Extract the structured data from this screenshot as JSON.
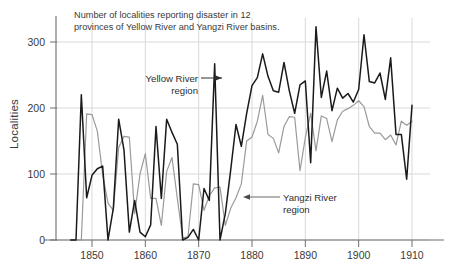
{
  "figure": {
    "title_line1": "Number of localities reporting disaster in 12",
    "title_line2": "provinces of Yellow River and Yangzi River basins.",
    "y_axis_label": "Localities",
    "annotation_yellow_line1": "Yellow River",
    "annotation_yellow_line2": "region",
    "annotation_yangzi_line1": "Yangzi River",
    "annotation_yangzi_line2": "region",
    "colors": {
      "yellow_river_line": "#1a1a1a",
      "yangzi_river_line": "#9a9a9a",
      "grid": "#d9d9d9",
      "axis": "#6e6e6e",
      "text": "#3a3a3a",
      "background": "#ffffff"
    }
  },
  "chart_data": {
    "type": "line",
    "title": "Number of localities reporting disaster in 12 provinces of Yellow River and Yangzi River basins.",
    "xlabel": "",
    "ylabel": "Localities",
    "xlim": [
      1846,
      1912
    ],
    "ylim": [
      0,
      320
    ],
    "xticks": [
      1850,
      1860,
      1870,
      1880,
      1890,
      1900,
      1910
    ],
    "yticks": [
      0,
      100,
      200,
      300
    ],
    "grid": true,
    "legend": "annotations",
    "series": [
      {
        "name": "Yellow River region",
        "color": "#1a1a1a",
        "x": [
          1846,
          1847,
          1848,
          1849,
          1850,
          1851,
          1852,
          1853,
          1854,
          1855,
          1856,
          1857,
          1858,
          1859,
          1860,
          1861,
          1862,
          1863,
          1864,
          1865,
          1866,
          1867,
          1868,
          1869,
          1870,
          1871,
          1872,
          1873,
          1874,
          1875,
          1876,
          1877,
          1878,
          1879,
          1880,
          1881,
          1882,
          1883,
          1884,
          1885,
          1886,
          1887,
          1888,
          1889,
          1890,
          1891,
          1892,
          1893,
          1894,
          1895,
          1896,
          1897,
          1898,
          1899,
          1900,
          1901,
          1902,
          1903,
          1904,
          1905,
          1906,
          1907,
          1908,
          1909,
          1910
        ],
        "values": [
          0,
          0,
          220,
          64,
          98,
          108,
          112,
          0,
          48,
          183,
          136,
          12,
          60,
          12,
          5,
          23,
          172,
          63,
          183,
          163,
          145,
          0,
          4,
          16,
          0,
          78,
          60,
          267,
          0,
          40,
          106,
          175,
          142,
          192,
          234,
          246,
          282,
          248,
          226,
          224,
          269,
          226,
          192,
          235,
          241,
          117,
          323,
          216,
          256,
          196,
          230,
          215,
          222,
          209,
          228,
          311,
          240,
          238,
          253,
          213,
          276,
          160,
          160,
          92,
          204
        ]
      },
      {
        "name": "Yangzi River region",
        "color": "#9a9a9a",
        "x": [
          1846,
          1847,
          1848,
          1849,
          1850,
          1851,
          1852,
          1853,
          1854,
          1855,
          1856,
          1857,
          1858,
          1859,
          1860,
          1861,
          1862,
          1863,
          1864,
          1865,
          1866,
          1867,
          1868,
          1869,
          1870,
          1871,
          1872,
          1873,
          1874,
          1875,
          1876,
          1877,
          1878,
          1879,
          1880,
          1881,
          1882,
          1883,
          1884,
          1885,
          1886,
          1887,
          1888,
          1889,
          1890,
          1891,
          1892,
          1893,
          1894,
          1895,
          1896,
          1897,
          1898,
          1899,
          1900,
          1901,
          1902,
          1903,
          1904,
          1905,
          1906,
          1907,
          1908,
          1909,
          1910
        ],
        "values": [
          0,
          0,
          0,
          191,
          190,
          165,
          99,
          56,
          45,
          140,
          157,
          156,
          40,
          100,
          131,
          63,
          63,
          22,
          104,
          125,
          63,
          3,
          5,
          85,
          84,
          45,
          67,
          79,
          80,
          22,
          48,
          64,
          85,
          150,
          156,
          180,
          219,
          160,
          154,
          132,
          172,
          187,
          186,
          105,
          155,
          192,
          135,
          188,
          184,
          149,
          182,
          195,
          199,
          204,
          211,
          202,
          172,
          162,
          162,
          152,
          159,
          144,
          180,
          174,
          180
        ]
      }
    ]
  }
}
